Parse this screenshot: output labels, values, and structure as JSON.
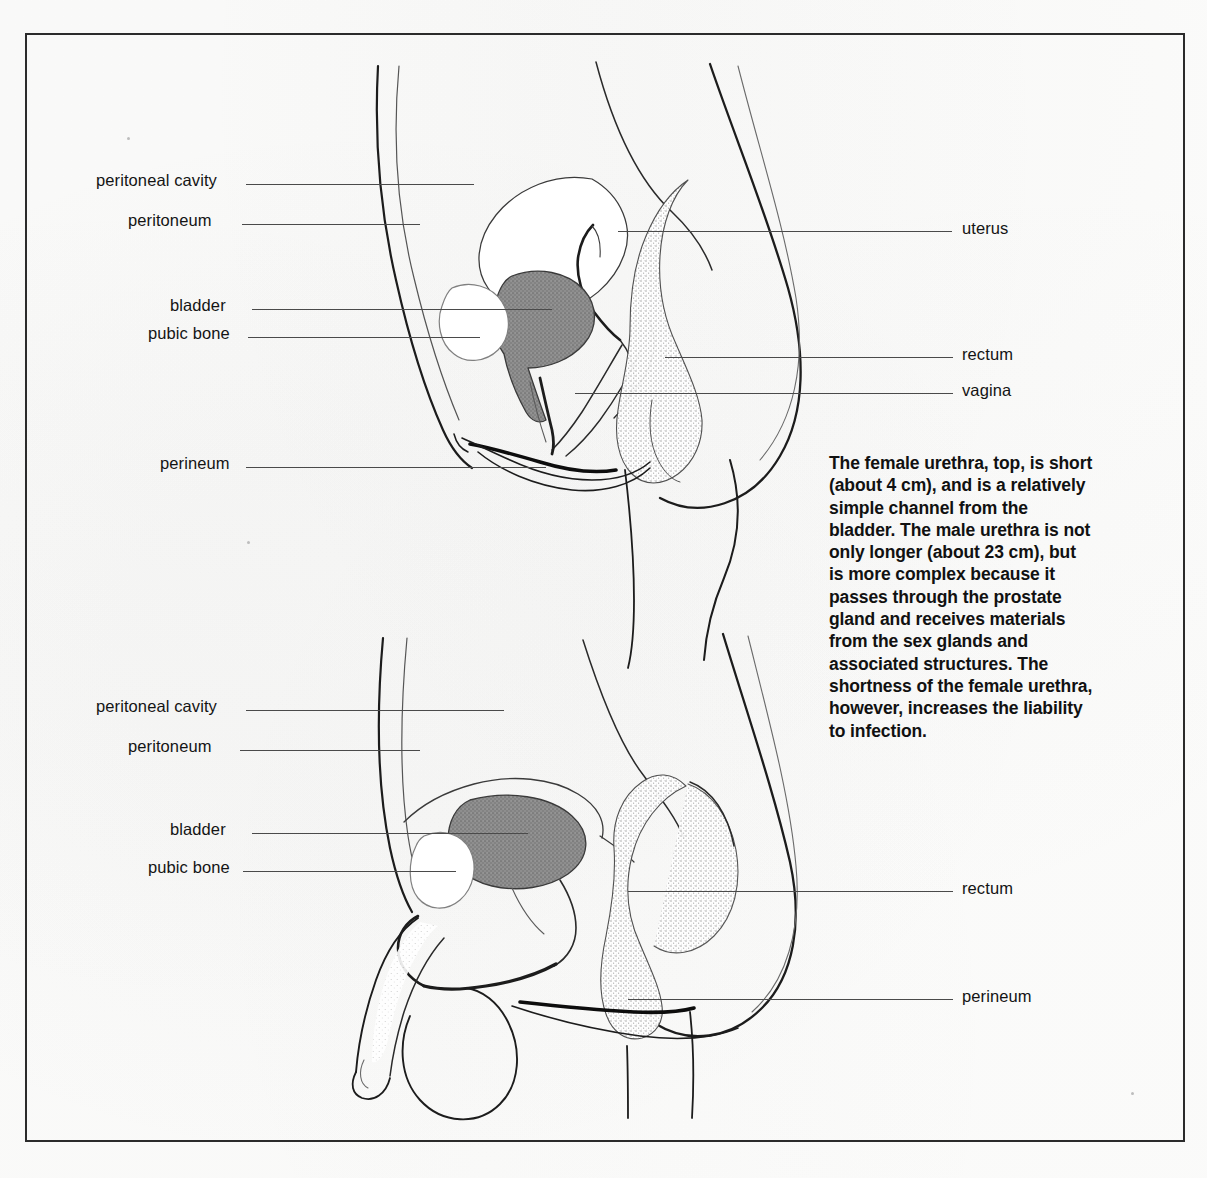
{
  "page": {
    "background_color": "#fdfdfc",
    "frame_color": "#2b2b2b",
    "ink_color": "#141414",
    "leader_color": "#4a4a4a",
    "bladder_fill": "#8a8a8a",
    "rectum_stipple": "#b7b7b7"
  },
  "caption": {
    "text": "The female urethra, top, is short (about 4 cm), and is a relatively simple channel from the bladder. The male urethra is not only longer (about 23 cm), but is more complex because it passes through the prostate gland and receives materials from the sex glands and associated structures. The shortness of the female urethra, however, increases the liability to infection.",
    "lines": [
      "The female urethra, top, is short",
      "(about 4 cm), and is a relatively",
      "simple channel from the",
      "bladder. The male urethra is not",
      "only longer (about 23 cm), but",
      "is more complex because it",
      "passes through the prostate",
      "gland and receives materials",
      "from the sex glands and",
      "associated structures. The",
      "shortness of the female urethra,",
      "however, increases the liability",
      "to infection."
    ]
  },
  "figures": [
    {
      "id": "female-pelvis",
      "name": "Female pelvic sagittal section",
      "position": "top",
      "labels_left": [
        {
          "key": "peritoneal-cavity",
          "text": "peritoneal cavity"
        },
        {
          "key": "peritoneum",
          "text": "peritoneum"
        },
        {
          "key": "bladder",
          "text": "bladder"
        },
        {
          "key": "pubic-bone",
          "text": "pubic bone"
        },
        {
          "key": "perineum",
          "text": "perineum"
        }
      ],
      "labels_right": [
        {
          "key": "uterus",
          "text": "uterus"
        },
        {
          "key": "rectum",
          "text": "rectum"
        },
        {
          "key": "vagina",
          "text": "vagina"
        }
      ]
    },
    {
      "id": "male-pelvis",
      "name": "Male pelvic sagittal section",
      "position": "bottom",
      "labels_left": [
        {
          "key": "peritoneal-cavity",
          "text": "peritoneal cavity"
        },
        {
          "key": "peritoneum",
          "text": "peritoneum"
        },
        {
          "key": "bladder",
          "text": "bladder"
        },
        {
          "key": "pubic-bone",
          "text": "pubic bone"
        }
      ],
      "labels_right": [
        {
          "key": "rectum",
          "text": "rectum"
        },
        {
          "key": "perineum",
          "text": "perineum"
        }
      ]
    }
  ]
}
